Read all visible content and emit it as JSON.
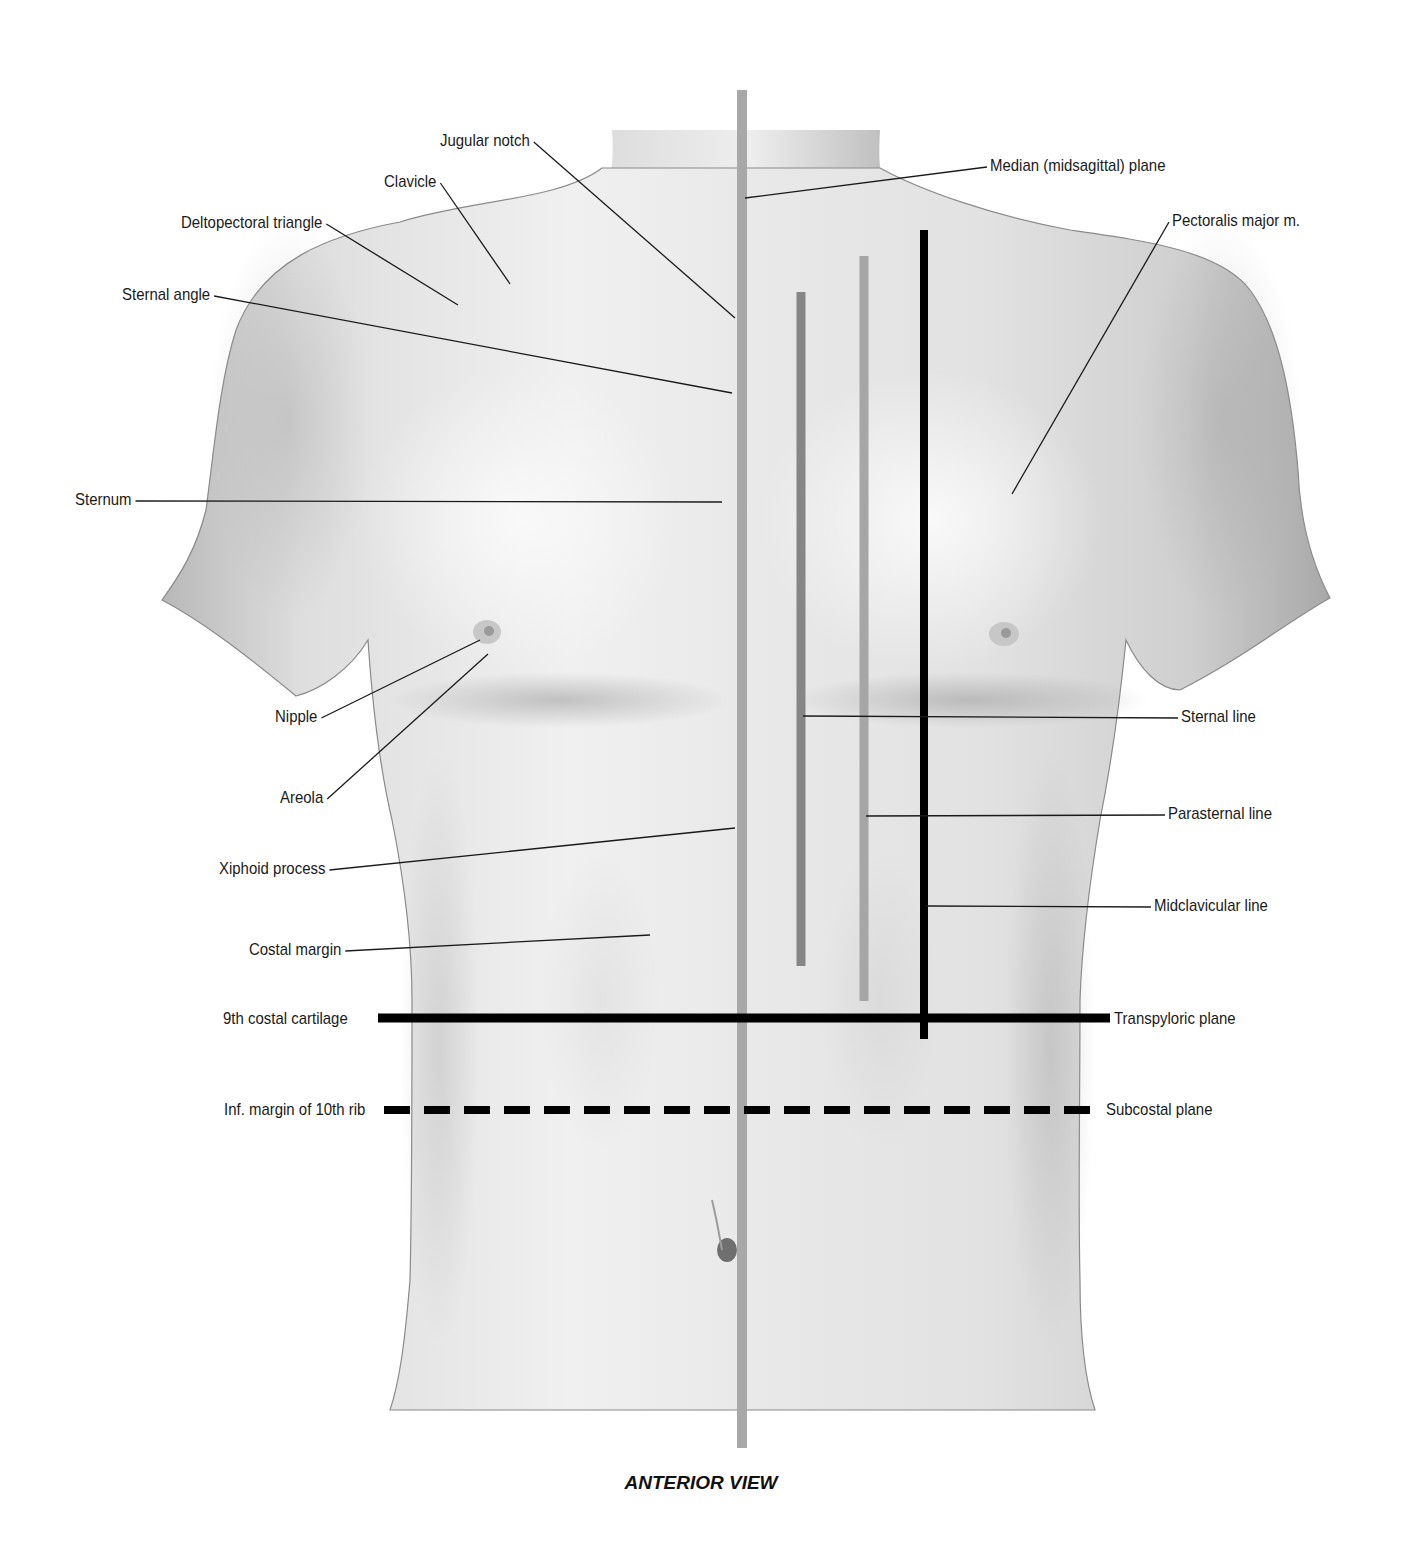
{
  "figure": {
    "caption": "ANTERIOR VIEW"
  },
  "labels_left": [
    {
      "id": "jugular-notch",
      "text": "Jugular notch",
      "x": 440,
      "y": 131,
      "target": [
        735,
        318
      ]
    },
    {
      "id": "clavicle",
      "text": "Clavicle",
      "x": 384,
      "y": 172,
      "target": [
        510,
        284
      ]
    },
    {
      "id": "deltopectoral-triangle",
      "text": "Deltopectoral triangle",
      "x": 181,
      "y": 213,
      "target": [
        458,
        305
      ]
    },
    {
      "id": "sternal-angle",
      "text": "Sternal angle",
      "x": 122,
      "y": 285,
      "target": [
        732,
        393
      ]
    },
    {
      "id": "sternum",
      "text": "Sternum",
      "x": 75,
      "y": 490,
      "target": [
        722,
        502
      ]
    },
    {
      "id": "nipple",
      "text": "Nipple",
      "x": 275,
      "y": 707,
      "target": [
        480,
        640
      ]
    },
    {
      "id": "areola",
      "text": "Areola",
      "x": 280,
      "y": 788,
      "target": [
        488,
        654
      ]
    },
    {
      "id": "xiphoid-process",
      "text": "Xiphoid process",
      "x": 219,
      "y": 859,
      "target": [
        735,
        828
      ]
    },
    {
      "id": "costal-margin",
      "text": "Costal margin",
      "x": 249,
      "y": 940,
      "target": [
        650,
        935
      ]
    },
    {
      "id": "9th-costal-cartilage",
      "text": "9th costal cartilage",
      "x": 223,
      "y": 1009
    },
    {
      "id": "inf-margin-10th-rib",
      "text": "Inf. margin of 10th rib",
      "x": 224,
      "y": 1100
    }
  ],
  "labels_right": [
    {
      "id": "median-plane",
      "text": "Median (midsagittal) plane",
      "x": 990,
      "y": 156,
      "target": [
        745,
        198
      ]
    },
    {
      "id": "pectoralis-major",
      "text": "Pectoralis major m.",
      "x": 1172,
      "y": 211,
      "target": [
        1012,
        494
      ]
    },
    {
      "id": "sternal-line",
      "text": "Sternal line",
      "x": 1181,
      "y": 707,
      "target": [
        803,
        716
      ]
    },
    {
      "id": "parasternal-line",
      "text": "Parasternal line",
      "x": 1168,
      "y": 804,
      "target": [
        866,
        816
      ]
    },
    {
      "id": "midclavicular-line",
      "text": "Midclavicular line",
      "x": 1154,
      "y": 896,
      "target": [
        926,
        906
      ]
    },
    {
      "id": "transpyloric-plane",
      "text": "Transpyloric plane",
      "x": 1114,
      "y": 1009
    },
    {
      "id": "subcostal-plane",
      "text": "Subcostal plane",
      "x": 1106,
      "y": 1100
    }
  ],
  "reference_lines": {
    "median_plane": {
      "x": 742,
      "y1": 90,
      "y2": 1448,
      "width": 10,
      "color": "#a8a8a8"
    },
    "sternal_line": {
      "x": 801,
      "y1": 292,
      "y2": 966,
      "width": 9,
      "color": "#868686"
    },
    "parasternal_line": {
      "x": 864,
      "y1": 256,
      "y2": 1001,
      "width": 9,
      "color": "#a6a6a6"
    },
    "midclavicular_line": {
      "x": 924,
      "y1": 230,
      "y2": 1039,
      "width": 8,
      "color": "#000000"
    },
    "transpyloric_plane": {
      "y": 1018,
      "x1": 378,
      "x2": 1110,
      "width": 9,
      "color": "#000000",
      "style": "solid"
    },
    "subcostal_plane": {
      "y": 1110,
      "x1": 384,
      "x2": 1102,
      "width": 8,
      "color": "#000000",
      "style": "dashed"
    }
  },
  "colors": {
    "skin_light": "#f1f1f1",
    "skin_mid": "#d9d9d9",
    "skin_shadow": "#a9a9a9",
    "leader": "#1a1a1a"
  }
}
